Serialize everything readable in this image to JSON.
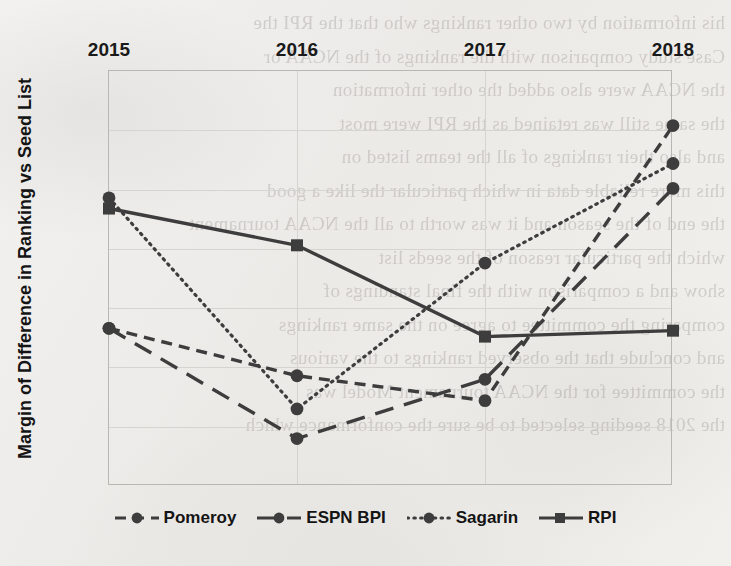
{
  "page": {
    "background_color": "#efeeec",
    "bleed_through_text": "his information by two other rankings who that the RPI the\nCase study comparison with the rankings of the NCAA or\nthe NCAA were also added the other information\nthe same still was retained as the RPI were most\nand also their rankings of all the teams listed on\nthis more reliable data in which particular the like a good\nthe end of the season and it was worth to all the NCAA tournament\nwhich the particular reason of the seeds list\nshow and a comparison with the final standings of\ncomparing the committee to agree on the same rankings\nand conclude that the observed rankings to the various\nthe committee for the NCAA tournament Model was\nthe 2018 seeding selected to be sure the conformance which\n"
  },
  "chart_data": {
    "type": "line",
    "title": "",
    "xlabel": "",
    "ylabel": "Margin of Difference in Ranking vs Seed List",
    "x_axis_position": "top",
    "y_axis_inverted": true,
    "ylim": [
      3,
      6.5
    ],
    "yticks": [
      3,
      3.5,
      4,
      4.5,
      5,
      5.5,
      6,
      6.5
    ],
    "ytick_labels": [
      "3",
      "3.5",
      "4",
      "4.5",
      "5",
      "5.5",
      "6",
      "6.5"
    ],
    "grid": true,
    "legend_position": "bottom",
    "categories": [
      "2015",
      "2016",
      "2017",
      "2018"
    ],
    "series": [
      {
        "name": "Pomeroy",
        "values": [
          5.17,
          5.57,
          5.78,
          3.46
        ],
        "line_style": "dashed-short",
        "marker": "circle",
        "color": "#3d3d3d"
      },
      {
        "name": "ESPN BPI",
        "values": [
          5.17,
          6.1,
          5.6,
          3.99
        ],
        "line_style": "dashed-long",
        "marker": "circle",
        "color": "#3d3d3d"
      },
      {
        "name": "Sagarin",
        "values": [
          4.07,
          5.85,
          4.62,
          3.78
        ],
        "line_style": "dotted",
        "marker": "circle",
        "color": "#3d3d3d"
      },
      {
        "name": "RPI",
        "values": [
          4.16,
          4.47,
          5.24,
          5.19
        ],
        "line_style": "solid",
        "marker": "square",
        "color": "#3d3d3d"
      }
    ]
  }
}
